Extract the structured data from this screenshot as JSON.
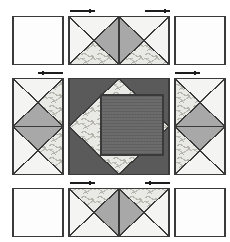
{
  "diagram": {
    "canvas": {
      "width": 230,
      "height": 242,
      "background": "#ffffff"
    }
  },
  "palette": {
    "background": "#ffffff",
    "outline": "#3a3a3a",
    "plain_white": "#fdfdfd",
    "light_cream": "#f2f2f0",
    "medium_gray": "#a8a8a8",
    "dark_gray": "#5a5a5a",
    "print_base": "#e6e6e2",
    "print_mark": "#b8b8b2",
    "texture_dark": "#6b6b6b",
    "arrow": "#1d1d1d"
  },
  "grid": {
    "columns": 3,
    "rows": 3,
    "unit_size": 51,
    "gutter": 6
  },
  "rows": [
    {
      "name": "top-row",
      "units": [
        {
          "name": "plain-square-top-left",
          "type": "plain-square",
          "fill": "plain_white",
          "w": 1,
          "h": 1
        },
        {
          "name": "hourglass-unit-top",
          "type": "hourglass-double",
          "orientation": "horizontal",
          "w": 2,
          "h": 1
        },
        {
          "name": "plain-square-top-right",
          "type": "plain-square",
          "fill": "plain_white",
          "w": 1,
          "h": 1
        }
      ]
    },
    {
      "name": "middle-row",
      "units": [
        {
          "name": "hourglass-unit-left",
          "type": "hourglass-double",
          "orientation": "vertical",
          "w": 1,
          "h": 2
        },
        {
          "name": "center-unit",
          "type": "square-in-square",
          "w": 2,
          "h": 2
        },
        {
          "name": "hourglass-unit-right",
          "type": "hourglass-double",
          "orientation": "vertical",
          "w": 1,
          "h": 2,
          "mirrored": true
        }
      ]
    },
    {
      "name": "bottom-row",
      "units": [
        {
          "name": "plain-square-bottom-left",
          "type": "plain-square",
          "fill": "plain_white",
          "w": 1,
          "h": 1
        },
        {
          "name": "hourglass-unit-bottom",
          "type": "hourglass-double",
          "orientation": "horizontal",
          "w": 2,
          "h": 1,
          "flipped": true
        },
        {
          "name": "plain-square-bottom-right",
          "type": "plain-square",
          "fill": "plain_white",
          "w": 1,
          "h": 1
        }
      ]
    }
  ],
  "arrows": [
    {
      "name": "pressing-arrow-top-left",
      "direction": "right",
      "row": "top",
      "side": "left"
    },
    {
      "name": "pressing-arrow-top-right",
      "direction": "right",
      "row": "top",
      "side": "right"
    },
    {
      "name": "pressing-arrow-middle-left",
      "direction": "left",
      "row": "middle",
      "side": "left"
    },
    {
      "name": "pressing-arrow-middle-right",
      "direction": "right",
      "row": "middle",
      "side": "right"
    },
    {
      "name": "pressing-arrow-bottom-left",
      "direction": "right",
      "row": "bottom",
      "side": "left"
    },
    {
      "name": "pressing-arrow-bottom-right",
      "direction": "left",
      "row": "bottom",
      "side": "right"
    }
  ],
  "center_unit": {
    "background_fill": "dark_gray",
    "diamond_corner_triangles": "print",
    "inner_square_fill": "texture_dark",
    "inner_square_size": 33
  }
}
